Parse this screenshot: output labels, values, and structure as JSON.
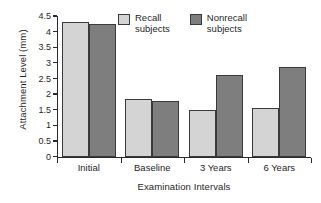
{
  "chart_data": {
    "type": "bar",
    "title": "",
    "xlabel": "Examination Intervals",
    "ylabel": "Attachment Level (mm)",
    "categories": [
      "Initial",
      "Baseline",
      "3 Years",
      "6 Years"
    ],
    "series": [
      {
        "name": "Recall\nsubjects",
        "legend_label": "Recall\nsubjects",
        "color": "#d4d4d4",
        "values": [
          4.3,
          1.85,
          1.48,
          1.55
        ]
      },
      {
        "name": "Nonrecall\nsubjects",
        "legend_label": "Nonrecall\nsubjects",
        "color": "#7e7e7e",
        "values": [
          4.25,
          1.77,
          2.6,
          2.87
        ]
      }
    ],
    "ylim": [
      0,
      4.5
    ],
    "yticks": [
      0,
      0.5,
      1,
      1.5,
      2,
      2.5,
      3,
      3.5,
      4,
      4.5
    ],
    "ytick_labels": [
      "0",
      "0.5",
      "1",
      "1.5",
      "2",
      "2.5",
      "3",
      "3.5",
      "4",
      "4.5"
    ],
    "grid": false,
    "legend_position": "top-center",
    "bar_edge_color": "#3a3a3a",
    "axis_color": "#2a2a2a"
  }
}
